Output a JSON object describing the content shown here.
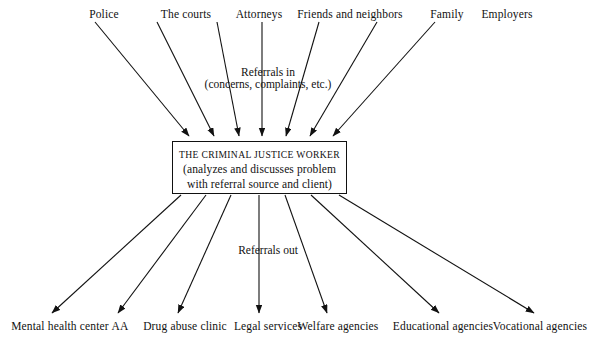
{
  "diagram": {
    "title_text": "Referrals in",
    "colors": {
      "line": "#111111",
      "text": "#111111",
      "background": "#ffffff"
    },
    "center_box": {
      "title": "THE CRIMINAL JUSTICE WORKER",
      "line2": "(analyzes and discusses problem",
      "line3": "with referral source and client)"
    },
    "labels": {
      "referrals_in": "Referrals in",
      "referrals_in_sub": "(concerns, complaints, etc.)",
      "referrals_out": "Referrals out"
    },
    "sources": [
      {
        "label": "Police",
        "x": 104,
        "y": 14
      },
      {
        "label": "The courts",
        "x": 186,
        "y": 14
      },
      {
        "label": "Attorneys",
        "x": 259,
        "y": 14
      },
      {
        "label": "Friends and neighbors",
        "x": 350,
        "y": 14
      },
      {
        "label": "Family",
        "x": 447,
        "y": 14
      },
      {
        "label": "Employers",
        "x": 507,
        "y": 14
      }
    ],
    "destinations": [
      {
        "label": "Mental health center",
        "x": 60,
        "y": 328
      },
      {
        "label": "AA",
        "x": 120,
        "y": 328
      },
      {
        "label": "Drug abuse clinic",
        "x": 185,
        "y": 328
      },
      {
        "label": "Legal services",
        "x": 268,
        "y": 328
      },
      {
        "label": "Welfare agencies",
        "x": 338,
        "y": 328
      },
      {
        "label": "Educational agencies",
        "x": 443,
        "y": 328
      },
      {
        "label": "Vocational agencies",
        "x": 540,
        "y": 328
      }
    ]
  }
}
